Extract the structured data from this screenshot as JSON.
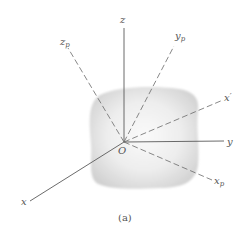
{
  "figure": {
    "caption": "(a)",
    "origin_label": "O",
    "axes": {
      "x": "x",
      "y": "y",
      "z": "z"
    },
    "principal_axes": {
      "xp": "x",
      "xp_sub": "p",
      "yp": "y",
      "yp_sub": "p",
      "zp": "z",
      "zp_sub": "p"
    },
    "arbitrary_axis": {
      "label": "x",
      "prime": "′"
    },
    "colors": {
      "axis_line": "#555555",
      "dashed_line": "#777777",
      "body_fill": "#d8d8d8",
      "text": "#555555"
    }
  }
}
